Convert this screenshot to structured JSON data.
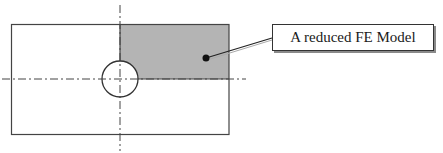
{
  "diagram": {
    "label": "A reduced FE Model",
    "colors": {
      "outline": "#444444",
      "shaded_region": "#b4b4b4",
      "centerline": "#444444",
      "dot": "#111111",
      "background": "#ffffff"
    },
    "elements": {
      "plate": "rectangular plate with central hole",
      "hole": "circle",
      "shaded_region": "upper-right quarter (reduced FE model)",
      "centerlines": [
        "horizontal symmetry axis",
        "vertical symmetry axis"
      ],
      "callout": "leader line from dot to label box"
    }
  }
}
